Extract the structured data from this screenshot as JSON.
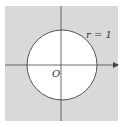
{
  "diagram": {
    "type": "unit-circle-region",
    "labels": {
      "radius": "r = 1",
      "origin": "O"
    },
    "colors": {
      "background": "#ffffff",
      "shaded_region": "#d9d9d9",
      "circle_fill": "#ffffff",
      "lines": "#444444",
      "text": "#333333"
    },
    "geometry": {
      "shaded_square": {
        "x": 5,
        "y": 6,
        "width": 113,
        "height": 115
      },
      "circle": {
        "cx": 62,
        "cy": 65,
        "r": 35
      },
      "x_axis": {
        "x1": 5,
        "x2": 118,
        "y": 65,
        "arrow": "right"
      },
      "y_axis": {
        "x": 61,
        "y1": 6,
        "y2": 121
      }
    }
  }
}
